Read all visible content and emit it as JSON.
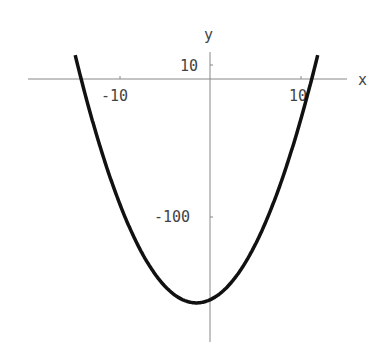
{
  "chart_data": {
    "type": "line",
    "title": "",
    "xlabel": "x",
    "ylabel": "y",
    "xticks": [
      -10,
      10
    ],
    "yticks": [
      10,
      -100
    ],
    "xlim": [
      -20,
      15
    ],
    "ylim": [
      -190,
      20
    ],
    "grid": false,
    "series": [
      {
        "name": "y = x^2 + 3x - 160",
        "x": [
          -15,
          -14.2,
          -10,
          -5,
          -1.5,
          0,
          5,
          10,
          11.2,
          12
        ],
        "values": [
          20,
          0,
          -90,
          -150,
          -162.25,
          -160,
          -120,
          -30,
          0,
          20
        ]
      }
    ]
  },
  "labels": {
    "x_axis": "x",
    "y_axis": "y",
    "xtick_neg": "-10",
    "xtick_pos": "10",
    "ytick_pos": "10",
    "ytick_neg": "-100"
  },
  "colors": {
    "curve": "#111111",
    "axis": "#888888",
    "text": "#444444"
  }
}
